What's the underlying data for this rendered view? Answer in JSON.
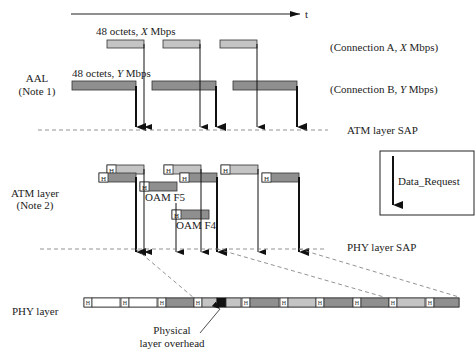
{
  "diagram": {
    "time_axis_label": "t",
    "aal": {
      "layer_label_line1": "AAL",
      "layer_label_line2": "(Note 1)",
      "conn_a_pdu_label_prefix": "48 octets, ",
      "conn_a_pdu_label_var": "X",
      "conn_a_pdu_label_suffix": " Mbps",
      "conn_b_pdu_label_prefix": "48 octets, ",
      "conn_b_pdu_label_var": "Y",
      "conn_b_pdu_label_suffix": " Mbps",
      "conn_a_label_prefix": "(Connection A, ",
      "conn_a_label_var": "X",
      "conn_a_label_suffix": " Mbps)",
      "conn_b_label_prefix": "(Connection B, ",
      "conn_b_label_var": "Y",
      "conn_b_label_suffix": " Mbps)"
    },
    "atm_sap_label": "ATM layer SAP",
    "atm": {
      "layer_label_line1": "ATM layer",
      "layer_label_line2": "(Note 2)",
      "header_glyph": "H",
      "oam_f5_label": "OAM F5",
      "oam_f4_label": "OAM F4"
    },
    "phy_sap_label": "PHY layer SAP",
    "phy": {
      "layer_label": "PHY layer",
      "overhead_label_line1": "Physical",
      "overhead_label_line2": "layer overhead"
    },
    "legend": {
      "label": "Data_Request",
      "icon": "down-arrow-icon"
    },
    "colors": {
      "conn_a_fill": "#c4c4c4",
      "conn_b_fill": "#8f8f8f",
      "oam_fill": "#8f8f8f",
      "empty_fill": "#ffffff",
      "overhead_fill": "#111111",
      "stroke": "#333333"
    }
  }
}
